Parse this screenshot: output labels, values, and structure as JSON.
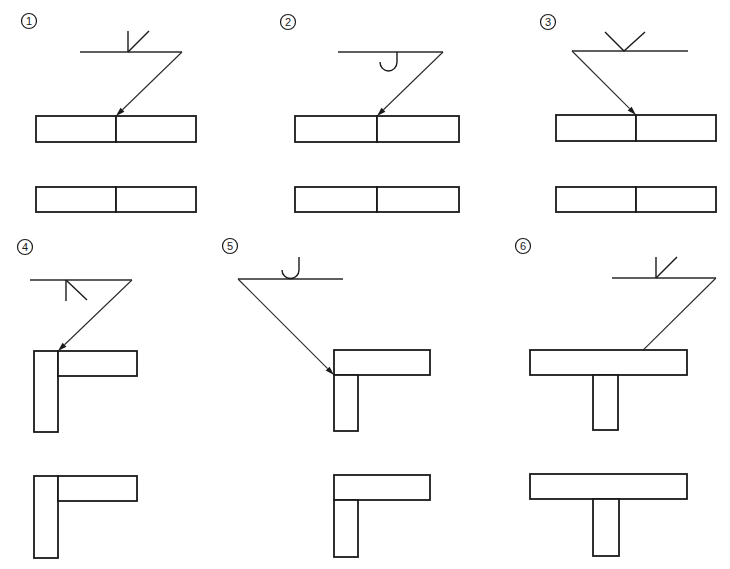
{
  "colors": {
    "ink": "#1a1a1a",
    "paper": "#ffffff"
  },
  "diagrams": [
    {
      "label": "1",
      "label_pos": [
        29,
        21
      ],
      "ref_line": [
        80,
        52,
        182,
        52
      ],
      "symbol": {
        "type": "bevel-arrow-side",
        "paths": [
          "M128,31 L128,52",
          "M128,52 L149,31"
        ]
      },
      "leader": {
        "from": [
          182,
          52
        ],
        "to": [
          116,
          116
        ]
      },
      "plates_with_symbol": [
        {
          "x": 36,
          "y": 116,
          "w": 80,
          "h": 26
        },
        {
          "x": 116,
          "y": 116,
          "w": 80,
          "h": 26
        }
      ],
      "plates_result": [
        {
          "x": 36,
          "y": 187,
          "w": 80,
          "h": 25
        },
        {
          "x": 116,
          "y": 187,
          "w": 80,
          "h": 25
        }
      ]
    },
    {
      "label": "2",
      "label_pos": [
        288,
        22
      ],
      "ref_line": [
        338,
        52,
        443,
        52
      ],
      "symbol": {
        "type": "j-groove-arrow-side",
        "paths": [
          "M397,52 L397,62 A8.5,9 0 0 1 380,62"
        ]
      },
      "leader": {
        "from": [
          443,
          52
        ],
        "to": [
          377,
          116
        ]
      },
      "plates_with_symbol": [
        {
          "x": 295,
          "y": 116,
          "w": 82,
          "h": 26
        },
        {
          "x": 377,
          "y": 116,
          "w": 82,
          "h": 26
        }
      ],
      "plates_result": [
        {
          "x": 295,
          "y": 187,
          "w": 82,
          "h": 25
        },
        {
          "x": 377,
          "y": 187,
          "w": 82,
          "h": 25
        }
      ]
    },
    {
      "label": "3",
      "label_pos": [
        548,
        22
      ],
      "ref_line": [
        572,
        51,
        688,
        51
      ],
      "symbol": {
        "type": "v-groove-other-side",
        "paths": [
          "M605,32 L624,51 L645,32"
        ]
      },
      "leader": {
        "from": [
          572,
          51
        ],
        "to": [
          636,
          115
        ]
      },
      "plates_with_symbol": [
        {
          "x": 556,
          "y": 115,
          "w": 80,
          "h": 26
        },
        {
          "x": 636,
          "y": 115,
          "w": 80,
          "h": 26
        }
      ],
      "plates_result": [
        {
          "x": 556,
          "y": 187,
          "w": 80,
          "h": 25
        },
        {
          "x": 636,
          "y": 187,
          "w": 80,
          "h": 25
        }
      ]
    },
    {
      "label": "4",
      "label_pos": [
        25,
        247
      ],
      "ref_line": [
        30,
        280,
        132,
        280
      ],
      "symbol": {
        "type": "bevel-arrow-side-below",
        "paths": [
          "M66,280 L66,301",
          "M66,280 L87,300"
        ]
      },
      "leader": {
        "from": [
          132,
          280
        ],
        "to": [
          58,
          351
        ]
      },
      "plates_with_symbol": [
        {
          "x": 34,
          "y": 351,
          "w": 24,
          "h": 81
        },
        {
          "x": 58,
          "y": 351,
          "w": 79,
          "h": 25
        }
      ],
      "plates_result": [
        {
          "x": 34,
          "y": 476,
          "w": 24,
          "h": 82
        },
        {
          "x": 58,
          "y": 476,
          "w": 79,
          "h": 25
        }
      ]
    },
    {
      "label": "5",
      "label_pos": [
        230,
        246
      ],
      "ref_line": [
        238,
        279,
        343,
        279
      ],
      "symbol": {
        "type": "j-groove-other-side",
        "paths": [
          "M299,257 L299,270 A8.5,8.5 0 0 1 282,270"
        ]
      },
      "leader": {
        "from": [
          238,
          279
        ],
        "to": [
          334,
          375
        ]
      },
      "plates_with_symbol": [
        {
          "x": 334,
          "y": 350,
          "w": 96,
          "h": 25
        },
        {
          "x": 334,
          "y": 375,
          "w": 24,
          "h": 56
        }
      ],
      "plates_result": [
        {
          "x": 334,
          "y": 475,
          "w": 96,
          "h": 25
        },
        {
          "x": 334,
          "y": 500,
          "w": 24,
          "h": 57
        }
      ]
    },
    {
      "label": "6",
      "label_pos": [
        523,
        246
      ],
      "ref_line": [
        612,
        278,
        716,
        278
      ],
      "symbol": {
        "type": "bevel-other-side",
        "paths": [
          "M656,257 L656,278",
          "M656,278 L677,257"
        ]
      },
      "leader": {
        "from": [
          716,
          278
        ],
        "to": [
          618,
          375
        ]
      },
      "plates_with_symbol": [
        {
          "x": 530,
          "y": 350,
          "w": 157,
          "h": 25
        },
        {
          "x": 593,
          "y": 375,
          "w": 25,
          "h": 55
        }
      ],
      "plates_result": [
        {
          "x": 530,
          "y": 474,
          "w": 157,
          "h": 25
        },
        {
          "x": 593,
          "y": 499,
          "w": 26,
          "h": 57
        }
      ]
    }
  ]
}
